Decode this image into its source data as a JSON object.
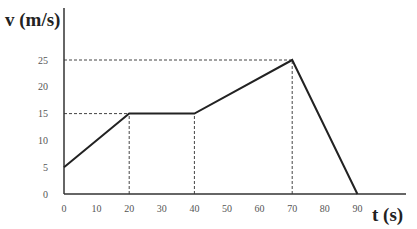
{
  "chart_data": {
    "type": "line",
    "title": "",
    "xlabel": "t (s)",
    "ylabel": "v (m/s)",
    "x": [
      0,
      20,
      40,
      70,
      90
    ],
    "series": [
      {
        "name": "velocity",
        "values": [
          5,
          15,
          15,
          25,
          0
        ]
      }
    ],
    "xticks": [
      0,
      10,
      20,
      30,
      40,
      50,
      60,
      70,
      80,
      90
    ],
    "yticks": [
      0,
      5,
      10,
      15,
      20,
      25
    ],
    "xlim": [
      0,
      105
    ],
    "ylim": [
      0,
      35
    ],
    "grid": false,
    "reference_lines": [
      {
        "type": "horizontal",
        "y": 15,
        "x_from": 0,
        "x_to": 20,
        "style": "dashed"
      },
      {
        "type": "horizontal",
        "y": 25,
        "x_from": 0,
        "x_to": 70,
        "style": "dashed"
      },
      {
        "type": "vertical",
        "x": 20,
        "y_from": 0,
        "y_to": 15,
        "style": "dashed"
      },
      {
        "type": "vertical",
        "x": 40,
        "y_from": 0,
        "y_to": 15,
        "style": "dashed"
      },
      {
        "type": "vertical",
        "x": 70,
        "y_from": 0,
        "y_to": 25,
        "style": "dashed"
      }
    ],
    "legend": null
  },
  "labels": {
    "y_axis": "v (m/s)",
    "x_axis": "t (s)",
    "xticks": [
      "0",
      "10",
      "20",
      "30",
      "40",
      "50",
      "60",
      "70",
      "80",
      "90"
    ],
    "yticks": [
      "0",
      "5",
      "10",
      "15",
      "20",
      "25"
    ]
  }
}
